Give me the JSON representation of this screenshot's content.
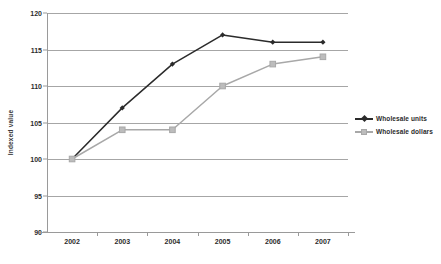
{
  "chart_data": {
    "type": "line",
    "title": "",
    "xlabel": "",
    "ylabel": "Indexed value",
    "categories": [
      "2002",
      "2003",
      "2004",
      "2005",
      "2006",
      "2007"
    ],
    "x": [
      2002,
      2003,
      2004,
      2005,
      2006,
      2007
    ],
    "ylim": [
      90,
      120
    ],
    "yticks": [
      90,
      95,
      100,
      105,
      110,
      115,
      120
    ],
    "ytick_labels": [
      "90",
      "95",
      "100",
      "105",
      "110",
      "115",
      "120"
    ],
    "grid": "horizontal",
    "legend_position": "right",
    "series": [
      {
        "name": "Wholesale units",
        "color": "#2b2b2b",
        "marker": "diamond",
        "values": [
          100,
          107,
          113,
          117,
          116,
          116
        ]
      },
      {
        "name": "Wholesale dollars",
        "color": "#a8a8a8",
        "marker": "square",
        "values": [
          100,
          104,
          104,
          110,
          113,
          114
        ]
      }
    ]
  },
  "axis": {
    "y_title": "Indexed value"
  },
  "legend": {
    "items": [
      {
        "label": "Wholesale units"
      },
      {
        "label": "Wholesale dollars"
      }
    ]
  },
  "colors": {
    "series_units": "#2b2b2b",
    "series_dollars": "#a8a8a8",
    "gridline": "#a6a6a6",
    "axis": "#9a9a9a",
    "background": "#ffffff",
    "text": "#2b2b2b"
  }
}
